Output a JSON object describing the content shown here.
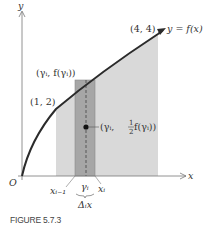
{
  "figure": {
    "caption": "FIGURE 5.7.3",
    "axes": {
      "x_label": "x",
      "y_label": "y",
      "origin_label": "O"
    },
    "curve": {
      "label": "y = f(x)",
      "description": "increasing concave curve from origin"
    },
    "points": {
      "start": "(1, 2)",
      "end": "(4, 4)",
      "sample": "(γᵢ, f(γᵢ))",
      "centroid_prefix": "(γᵢ, ",
      "centroid_frac_num": "1",
      "centroid_frac_den": "2",
      "centroid_suffix": " f(γᵢ))"
    },
    "ticks": {
      "left": "xᵢ₋₁",
      "mid": "γᵢ",
      "right": "xᵢ",
      "width": "Δᵢx"
    },
    "colors": {
      "region": "#d9d9d9",
      "strip": "#a6a6a6",
      "curve": "#2b2b2b",
      "axis": "#777777"
    }
  }
}
